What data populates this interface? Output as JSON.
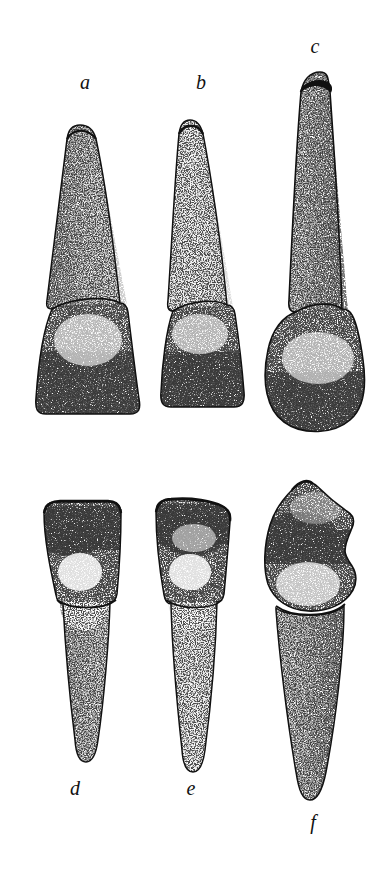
{
  "plate": {
    "title": "Anatomical plate of six teeth",
    "background_color": "#ffffff",
    "ink_color": "#111111",
    "width": 386,
    "height": 890,
    "style": "stipple engraving",
    "rows": [
      {
        "row_name": "upper-row",
        "orientation": "root-up-crown-down",
        "specimens": [
          "a",
          "b",
          "c"
        ]
      },
      {
        "row_name": "lower-row",
        "orientation": "crown-up-root-down",
        "specimens": [
          "d",
          "e",
          "f"
        ]
      }
    ]
  },
  "labels": {
    "a": "a",
    "b": "b",
    "c": "c",
    "d": "d",
    "e": "e",
    "f": "f"
  },
  "specimens": [
    {
      "id": "a",
      "label": "a",
      "row": "upper-row",
      "orientation": "root-up-crown-down",
      "apex_y": 125,
      "cervix_y": 305,
      "base_y": 415,
      "crown_width": 95,
      "root_tip_width": 22
    },
    {
      "id": "b",
      "label": "b",
      "row": "upper-row",
      "orientation": "root-up-crown-down",
      "apex_y": 120,
      "cervix_y": 313,
      "base_y": 408,
      "crown_width": 76,
      "root_tip_width": 20
    },
    {
      "id": "c",
      "label": "c",
      "row": "upper-row",
      "orientation": "root-up-crown-down",
      "apex_y": 72,
      "cervix_y": 312,
      "base_y": 428,
      "crown_width": 100,
      "root_tip_width": 26
    },
    {
      "id": "d",
      "label": "d",
      "row": "lower-row",
      "orientation": "crown-up-root-down",
      "crown_top_y": 502,
      "cervix_y": 598,
      "apex_y": 762,
      "crown_width": 78,
      "root_tip_width": 20
    },
    {
      "id": "e",
      "label": "e",
      "row": "lower-row",
      "orientation": "crown-up-root-down",
      "crown_top_y": 500,
      "cervix_y": 598,
      "apex_y": 772,
      "crown_width": 78,
      "root_tip_width": 20
    },
    {
      "id": "f",
      "label": "f",
      "row": "lower-row",
      "orientation": "crown-up-root-down",
      "crown_top_y": 482,
      "cervix_y": 606,
      "apex_y": 800,
      "crown_width": 96,
      "root_tip_width": 22
    }
  ]
}
